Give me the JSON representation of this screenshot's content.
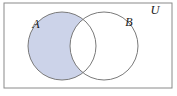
{
  "figure": {
    "kind": "venn-diagram",
    "title_visible": false,
    "background_color": "#ffffff"
  },
  "universe": {
    "label": "U",
    "label_x": 155,
    "label_y": 14,
    "rect": {
      "x": 4,
      "y": 3,
      "width": 168,
      "height": 85
    },
    "border_color": "#8a8a8a",
    "border_width": 1,
    "fill": "#ffffff"
  },
  "sets": [
    {
      "name": "A",
      "label": "A",
      "label_x": 36,
      "label_y": 28,
      "cx": 62,
      "cy": 46,
      "r": 34,
      "outline_color": "#7a7a7a",
      "outline_width": 1,
      "shaded": true
    },
    {
      "name": "B",
      "label": "B",
      "label_x": 129,
      "label_y": 26,
      "cx": 104,
      "cy": 46,
      "r": 34,
      "outline_color": "#7a7a7a",
      "outline_width": 1,
      "shaded": false
    }
  ],
  "shading": {
    "region_description": "A minus B",
    "fill_color": "#ccd3e9",
    "edge_color": "#9aa2c4"
  }
}
